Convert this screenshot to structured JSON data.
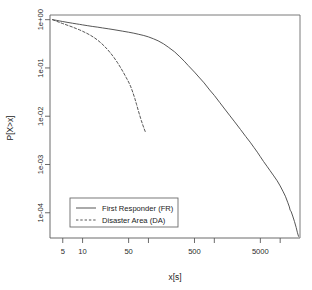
{
  "chart_data": {
    "type": "line",
    "title": "",
    "xlabel": "x[s]",
    "ylabel": "P[X>x]",
    "xscale": "log",
    "yscale": "log",
    "xlim": [
      3.2,
      20000
    ],
    "ylim": [
      3e-05,
      1.25
    ],
    "grid": false,
    "legend_position": "bottom-left",
    "xticks": [
      {
        "value": 5,
        "label": "5"
      },
      {
        "value": 10,
        "label": "10"
      },
      {
        "value": 50,
        "label": "50"
      },
      {
        "value": 100,
        "label": ""
      },
      {
        "value": 500,
        "label": "500"
      },
      {
        "value": 1000,
        "label": ""
      },
      {
        "value": 5000,
        "label": "5000"
      },
      {
        "value": 10000,
        "label": ""
      }
    ],
    "yticks": [
      {
        "value": 1,
        "label": "1e+00"
      },
      {
        "value": 0.1,
        "label": "1e-01"
      },
      {
        "value": 0.01,
        "label": "1e-02"
      },
      {
        "value": 0.001,
        "label": "1e-03"
      },
      {
        "value": 0.0001,
        "label": "1e-04"
      }
    ],
    "series": [
      {
        "name": "First Responder (FR)",
        "key": "FR",
        "style": "solid",
        "color": "#4d4d4d",
        "points": [
          [
            3.5,
            1.0
          ],
          [
            4.0,
            0.97
          ],
          [
            4.5,
            0.94
          ],
          [
            5.0,
            0.915
          ],
          [
            6.0,
            0.875
          ],
          [
            7.0,
            0.845
          ],
          [
            8.0,
            0.82
          ],
          [
            9.0,
            0.8
          ],
          [
            10.0,
            0.78
          ],
          [
            12.0,
            0.75
          ],
          [
            14.0,
            0.725
          ],
          [
            17.0,
            0.7
          ],
          [
            20.0,
            0.675
          ],
          [
            25.0,
            0.645
          ],
          [
            30.0,
            0.62
          ],
          [
            40.0,
            0.58
          ],
          [
            50.0,
            0.55
          ],
          [
            60.0,
            0.525
          ],
          [
            70.0,
            0.5
          ],
          [
            85.0,
            0.47
          ],
          [
            100.0,
            0.44
          ],
          [
            120.0,
            0.4
          ],
          [
            140.0,
            0.365
          ],
          [
            170.0,
            0.315
          ],
          [
            200.0,
            0.27
          ],
          [
            250.0,
            0.215
          ],
          [
            300.0,
            0.17
          ],
          [
            350.0,
            0.138
          ],
          [
            400.0,
            0.113
          ],
          [
            500.0,
            0.082
          ],
          [
            600.0,
            0.062
          ],
          [
            700.0,
            0.049
          ],
          [
            850.0,
            0.035
          ],
          [
            1000.0,
            0.027
          ],
          [
            1200.0,
            0.0195
          ],
          [
            1400.0,
            0.0148
          ],
          [
            1700.0,
            0.0105
          ],
          [
            2000.0,
            0.0079
          ],
          [
            2500.0,
            0.0053
          ],
          [
            3000.0,
            0.0038
          ],
          [
            3500.0,
            0.0029
          ],
          [
            4000.0,
            0.00225
          ],
          [
            4500.0,
            0.0018
          ],
          [
            5000.0,
            0.00145
          ],
          [
            5600.0,
            0.00115
          ],
          [
            6300.0,
            0.00092
          ],
          [
            7000.0,
            0.00075
          ],
          [
            8000.0,
            0.00058
          ],
          [
            9000.0,
            0.00046
          ],
          [
            10000.0,
            0.00036
          ],
          [
            11000.0,
            0.00028
          ],
          [
            12000.0,
            0.00022
          ],
          [
            13000.0,
            0.000165
          ],
          [
            13800.0,
            0.000132
          ],
          [
            14200.0,
            0.000112
          ],
          [
            14600.0,
            0.000108
          ],
          [
            15500.0,
            8.55e-05
          ],
          [
            16500.0,
            6.55e-05
          ],
          [
            17500.0,
            4.95e-05
          ],
          [
            18300.0,
            3.85e-05
          ],
          [
            19000.0,
            3.25e-05
          ]
        ]
      },
      {
        "name": "Disaster Area (DA)",
        "key": "DA",
        "style": "dashed",
        "color": "#4d4d4d",
        "points": [
          [
            3.5,
            1.0
          ],
          [
            4.0,
            0.93
          ],
          [
            4.5,
            0.875
          ],
          [
            5.0,
            0.83
          ],
          [
            6.0,
            0.76
          ],
          [
            7.0,
            0.705
          ],
          [
            8.0,
            0.655
          ],
          [
            9.0,
            0.615
          ],
          [
            10.0,
            0.575
          ],
          [
            11.5,
            0.525
          ],
          [
            13.0,
            0.48
          ],
          [
            15.0,
            0.425
          ],
          [
            17.0,
            0.375
          ],
          [
            19.0,
            0.33
          ],
          [
            21.0,
            0.29
          ],
          [
            24.0,
            0.24
          ],
          [
            27.0,
            0.198
          ],
          [
            30.0,
            0.164
          ],
          [
            34.0,
            0.128
          ],
          [
            38.0,
            0.1
          ],
          [
            42.0,
            0.079
          ],
          [
            46.0,
            0.063
          ],
          [
            50.0,
            0.051
          ],
          [
            54.0,
            0.0405
          ],
          [
            58.0,
            0.031
          ],
          [
            62.0,
            0.0235
          ],
          [
            66.0,
            0.0175
          ],
          [
            70.0,
            0.0132
          ],
          [
            74.0,
            0.0102
          ],
          [
            78.0,
            0.0081
          ],
          [
            82.0,
            0.0066
          ],
          [
            86.0,
            0.0055
          ],
          [
            90.0,
            0.0047
          ]
        ]
      }
    ]
  },
  "legend": {
    "entries": [
      {
        "label": "First Responder (FR)",
        "style": "solid"
      },
      {
        "label": "Disaster Area (DA)",
        "style": "dashed"
      }
    ]
  }
}
